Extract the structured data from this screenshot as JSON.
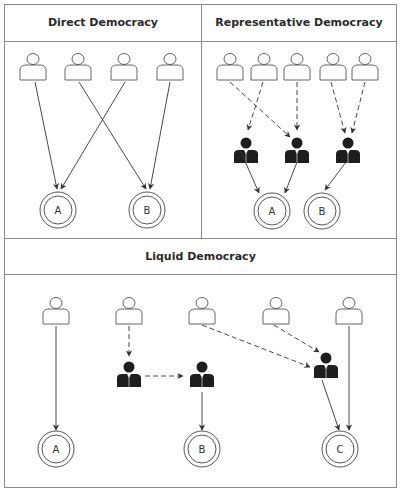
{
  "panels": {
    "direct": {
      "title": "Direct Democracy",
      "voters": 4,
      "options": [
        "A",
        "B"
      ],
      "edges": [
        {
          "from": "voter1",
          "to": "A",
          "style": "solid"
        },
        {
          "from": "voter2",
          "to": "B",
          "style": "solid"
        },
        {
          "from": "voter3",
          "to": "A",
          "style": "solid"
        },
        {
          "from": "voter4",
          "to": "B",
          "style": "solid"
        }
      ]
    },
    "representative": {
      "title": "Representative Democracy",
      "voters": 5,
      "representatives": 3,
      "options": [
        "A",
        "B"
      ],
      "edges": [
        {
          "from": "voter1",
          "to": "rep2",
          "style": "dashed"
        },
        {
          "from": "voter2",
          "to": "rep1",
          "style": "dashed"
        },
        {
          "from": "voter3",
          "to": "rep2",
          "style": "dashed"
        },
        {
          "from": "voter4",
          "to": "rep3",
          "style": "dashed"
        },
        {
          "from": "voter5",
          "to": "rep3",
          "style": "dashed"
        },
        {
          "from": "rep1",
          "to": "A",
          "style": "solid"
        },
        {
          "from": "rep2",
          "to": "A",
          "style": "solid"
        },
        {
          "from": "rep3",
          "to": "B",
          "style": "solid"
        }
      ]
    },
    "liquid": {
      "title": "Liquid Democracy",
      "voters": 5,
      "delegates": 3,
      "options": [
        "A",
        "B",
        "C"
      ],
      "edges": [
        {
          "from": "voter1",
          "to": "A",
          "style": "solid"
        },
        {
          "from": "voter2",
          "to": "delegate1",
          "style": "dashed"
        },
        {
          "from": "delegate1",
          "to": "delegate2",
          "style": "dashed"
        },
        {
          "from": "delegate2",
          "to": "B",
          "style": "solid"
        },
        {
          "from": "voter3",
          "to": "delegate3",
          "style": "dashed"
        },
        {
          "from": "voter4",
          "to": "delegate3",
          "style": "dashed"
        },
        {
          "from": "delegate3",
          "to": "C",
          "style": "solid"
        },
        {
          "from": "voter5",
          "to": "C",
          "style": "solid"
        }
      ]
    }
  },
  "colors": {
    "border": "#8a8a8a",
    "line": "#333333",
    "representative_fill": "#1e1e1e",
    "voter_fill": "#ffffff"
  }
}
